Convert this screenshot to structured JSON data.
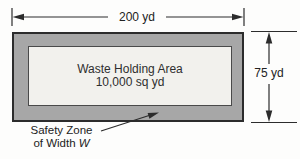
{
  "figure": {
    "top_dimension": {
      "label": "200 yd"
    },
    "right_dimension": {
      "label": "75 yd"
    },
    "waste_area": {
      "line1": "Waste Holding Area",
      "line2": "10,000 sq yd"
    },
    "safety_zone": {
      "label_line1": "Safety Zone",
      "label_line2_prefix": "of Width",
      "width_symbol": "W"
    },
    "colors": {
      "zone_fill": "#a7a7a7",
      "area_fill": "#f2f1ed",
      "line": "#2c2c2c",
      "page_bg": "#fdfdfc"
    }
  }
}
